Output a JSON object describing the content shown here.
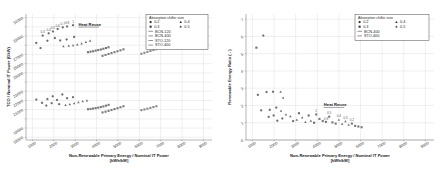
{
  "figure": {
    "background": "#ffffff",
    "panel_count": 2
  },
  "chart_data": [
    {
      "type": "scatter",
      "panel": "left",
      "title": "",
      "xlabel": "Non-Renewable Primary Energy / Nominal IT Power",
      "xlabel_units": "[kWh/kW]",
      "ylabel": "TCO / Nominal IT Power (€/kW)",
      "xlim": [
        700,
        9400
      ],
      "ylim": [
        17700,
        31400
      ],
      "xticks": [
        1000,
        2000,
        3000,
        4000,
        5000,
        6000,
        7000,
        8000,
        9000
      ],
      "yticks": [
        18000,
        19000,
        20000,
        21000,
        22000,
        23000,
        24000,
        25000,
        26000,
        27000,
        28000,
        29000,
        30000,
        31000
      ],
      "ytick_labels_shown": [
        18000,
        19000,
        21000,
        22000,
        23000,
        25000,
        26000,
        27000,
        29000,
        31000
      ],
      "grid": true,
      "grid_color": "#d9d9d9",
      "annotations": [
        {
          "text": "Heat Reuse",
          "x": 3150,
          "y": 30100,
          "underline": true
        }
      ],
      "legend": {
        "position": "top-right",
        "title": "Absorption chiller size",
        "size_entries": [
          {
            "label": "0.2",
            "marker": "hexagon"
          },
          {
            "label": "0.4",
            "marker": "triangle"
          },
          {
            "label": "0.3",
            "marker": "square"
          },
          {
            "label": "0.5",
            "marker": "star"
          }
        ],
        "line_entries": [
          {
            "label": "BCN-120",
            "marker": "line"
          },
          {
            "label": "BCN-400",
            "marker": "line"
          },
          {
            "label": "STO-120",
            "marker": "line"
          },
          {
            "label": "STO-400",
            "marker": "line"
          }
        ]
      },
      "series": [
        {
          "name": "BCN-120",
          "color": "#6f6f6f",
          "points": [
            {
              "x": 1180,
              "y": 28250,
              "m": "hexagon"
            },
            {
              "x": 1480,
              "y": 29050,
              "m": "hexagon",
              "label": "0.3"
            },
            {
              "x": 1760,
              "y": 29300,
              "m": "hexagon",
              "label": "0.4"
            },
            {
              "x": 1960,
              "y": 29500,
              "m": "hexagon",
              "label": "0.5"
            },
            {
              "x": 2180,
              "y": 29780,
              "m": "hexagon",
              "label": "0.6"
            },
            {
              "x": 2420,
              "y": 29950,
              "m": "hexagon",
              "label": "0.7"
            },
            {
              "x": 2620,
              "y": 30050,
              "m": "hexagon",
              "label": "0.8"
            },
            {
              "x": 2900,
              "y": 30180,
              "m": "hexagon",
              "label": "1"
            },
            {
              "x": 1380,
              "y": 27700,
              "m": "hexagon"
            },
            {
              "x": 1700,
              "y": 28500,
              "m": "hexagon"
            },
            {
              "x": 2050,
              "y": 28780,
              "m": "hexagon"
            },
            {
              "x": 2300,
              "y": 28520,
              "m": "hexagon"
            },
            {
              "x": 2600,
              "y": 28640,
              "m": "hexagon"
            },
            {
              "x": 2950,
              "y": 28900,
              "m": "hexagon"
            },
            {
              "x": 2450,
              "y": 27900,
              "m": "triangle"
            },
            {
              "x": 2700,
              "y": 27950,
              "m": "triangle"
            },
            {
              "x": 2900,
              "y": 28000,
              "m": "triangle"
            },
            {
              "x": 3100,
              "y": 28080,
              "m": "triangle"
            },
            {
              "x": 3300,
              "y": 28200,
              "m": "triangle"
            },
            {
              "x": 3500,
              "y": 28350,
              "m": "triangle"
            },
            {
              "x": 3700,
              "y": 28480,
              "m": "triangle"
            }
          ]
        },
        {
          "name": "BCN-120-band",
          "color": "#777777",
          "points": [
            {
              "x": 3600,
              "y": 27250,
              "m": "square"
            },
            {
              "x": 3720,
              "y": 27300,
              "m": "square"
            },
            {
              "x": 3840,
              "y": 27350,
              "m": "square"
            },
            {
              "x": 3960,
              "y": 27420,
              "m": "square"
            },
            {
              "x": 4080,
              "y": 27480,
              "m": "square"
            },
            {
              "x": 4200,
              "y": 27540,
              "m": "square"
            },
            {
              "x": 4320,
              "y": 27620,
              "m": "square"
            },
            {
              "x": 4440,
              "y": 27700,
              "m": "square"
            },
            {
              "x": 4560,
              "y": 27780,
              "m": "square"
            }
          ]
        },
        {
          "name": "BCN-400",
          "color": "#7d7d7d",
          "points": [
            {
              "x": 4280,
              "y": 26850,
              "m": "square"
            },
            {
              "x": 4420,
              "y": 26950,
              "m": "square"
            },
            {
              "x": 4560,
              "y": 27050,
              "m": "square"
            },
            {
              "x": 4700,
              "y": 27150,
              "m": "square"
            },
            {
              "x": 4840,
              "y": 27250,
              "m": "square"
            },
            {
              "x": 4980,
              "y": 27350,
              "m": "square"
            },
            {
              "x": 5120,
              "y": 27450,
              "m": "square"
            },
            {
              "x": 5260,
              "y": 27560,
              "m": "square"
            }
          ]
        },
        {
          "name": "STO-120",
          "color": "#888888",
          "points": [
            {
              "x": 6100,
              "y": 27080,
              "m": "square"
            },
            {
              "x": 6240,
              "y": 27180,
              "m": "square"
            },
            {
              "x": 6380,
              "y": 27280,
              "m": "square"
            },
            {
              "x": 6520,
              "y": 27380,
              "m": "square"
            },
            {
              "x": 6660,
              "y": 27480,
              "m": "square"
            },
            {
              "x": 6800,
              "y": 27570,
              "m": "square"
            }
          ]
        },
        {
          "name": "lower-cluster",
          "color": "#6f6f6f",
          "points": [
            {
              "x": 1180,
              "y": 22100,
              "m": "hexagon"
            },
            {
              "x": 1450,
              "y": 21750,
              "m": "hexagon"
            },
            {
              "x": 1700,
              "y": 22150,
              "m": "hexagon"
            },
            {
              "x": 1950,
              "y": 22450,
              "m": "hexagon"
            },
            {
              "x": 2150,
              "y": 22050,
              "m": "hexagon"
            },
            {
              "x": 2400,
              "y": 22650,
              "m": "hexagon"
            },
            {
              "x": 2620,
              "y": 22250,
              "m": "hexagon"
            },
            {
              "x": 2900,
              "y": 22350,
              "m": "hexagon"
            },
            {
              "x": 1650,
              "y": 21450,
              "m": "hexagon"
            },
            {
              "x": 1900,
              "y": 21700,
              "m": "hexagon"
            },
            {
              "x": 2250,
              "y": 21600,
              "m": "hexagon"
            },
            {
              "x": 2550,
              "y": 21500,
              "m": "triangle"
            },
            {
              "x": 2750,
              "y": 21600,
              "m": "triangle"
            },
            {
              "x": 2950,
              "y": 21700,
              "m": "triangle"
            },
            {
              "x": 3150,
              "y": 21800,
              "m": "triangle"
            },
            {
              "x": 3350,
              "y": 21900,
              "m": "triangle"
            },
            {
              "x": 3550,
              "y": 22000,
              "m": "triangle"
            }
          ]
        },
        {
          "name": "lower-band-1",
          "color": "#7a7a7a",
          "points": [
            {
              "x": 3600,
              "y": 21050,
              "m": "square"
            },
            {
              "x": 3720,
              "y": 21080,
              "m": "square"
            },
            {
              "x": 3840,
              "y": 21120,
              "m": "square"
            },
            {
              "x": 3960,
              "y": 21170,
              "m": "square"
            },
            {
              "x": 4080,
              "y": 21220,
              "m": "square"
            },
            {
              "x": 4200,
              "y": 21280,
              "m": "square"
            },
            {
              "x": 4320,
              "y": 21350,
              "m": "square"
            },
            {
              "x": 4440,
              "y": 21430,
              "m": "square"
            },
            {
              "x": 4560,
              "y": 21520,
              "m": "square"
            }
          ]
        },
        {
          "name": "lower-band-2",
          "color": "#7a7a7a",
          "points": [
            {
              "x": 4280,
              "y": 20700,
              "m": "square"
            },
            {
              "x": 4420,
              "y": 20780,
              "m": "square"
            },
            {
              "x": 4560,
              "y": 20870,
              "m": "square"
            },
            {
              "x": 4700,
              "y": 20960,
              "m": "square"
            },
            {
              "x": 4840,
              "y": 21060,
              "m": "square"
            },
            {
              "x": 4980,
              "y": 21160,
              "m": "square"
            },
            {
              "x": 5120,
              "y": 21260,
              "m": "square"
            },
            {
              "x": 5260,
              "y": 21370,
              "m": "square"
            }
          ]
        },
        {
          "name": "lower-band-3",
          "color": "#888888",
          "points": [
            {
              "x": 6100,
              "y": 20950,
              "m": "square"
            },
            {
              "x": 6240,
              "y": 21020,
              "m": "square"
            },
            {
              "x": 6380,
              "y": 21100,
              "m": "square"
            },
            {
              "x": 6520,
              "y": 21190,
              "m": "square"
            },
            {
              "x": 6660,
              "y": 21280,
              "m": "square"
            },
            {
              "x": 6800,
              "y": 21370,
              "m": "square"
            }
          ]
        }
      ]
    },
    {
      "type": "scatter",
      "panel": "right",
      "title": "",
      "xlabel": "Non-Renewable Primary Energy / Nominal IT Power",
      "xlabel_units": "[kWh/kW]",
      "ylabel": "Renewable Energy Ratio ( - )",
      "xlim": [
        700,
        9400
      ],
      "ylim": [
        0,
        7.3
      ],
      "xticks": [
        1000,
        2000,
        3000,
        4000,
        5000,
        6000,
        7000,
        8000,
        9000
      ],
      "yticks": [
        0,
        1,
        2,
        3,
        4,
        5,
        6,
        7
      ],
      "grid": true,
      "grid_color": "#d9d9d9",
      "annotations": [
        {
          "text": "Heat Reuse",
          "x": 4300,
          "y": 1.95,
          "underline": true
        }
      ],
      "legend": {
        "position": "top-right",
        "title": "Absorption chiller size",
        "size_entries": [
          {
            "label": "0.2",
            "marker": "hexagon"
          },
          {
            "label": "0.4",
            "marker": "triangle"
          },
          {
            "label": "0.3",
            "marker": "square"
          },
          {
            "label": "0.5",
            "marker": "star"
          }
        ],
        "line_entries": [
          {
            "label": "BCN-400",
            "marker": "line"
          },
          {
            "label": "STO-400",
            "marker": "line"
          }
        ]
      },
      "series": [
        {
          "name": "high-ratio",
          "color": "#6f6f6f",
          "points": [
            {
              "x": 1180,
              "y": 5.35,
              "m": "square"
            },
            {
              "x": 1500,
              "y": 6.05,
              "m": "hexagon"
            }
          ]
        },
        {
          "name": "mid-cluster",
          "color": "#6f6f6f",
          "points": [
            {
              "x": 1250,
              "y": 2.62,
              "m": "hexagon"
            },
            {
              "x": 1650,
              "y": 2.78,
              "m": "hexagon"
            },
            {
              "x": 1950,
              "y": 2.8,
              "m": "hexagon"
            },
            {
              "x": 2300,
              "y": 2.8,
              "m": "triangle"
            },
            {
              "x": 2420,
              "y": 2.45,
              "m": "triangle"
            },
            {
              "x": 1400,
              "y": 1.72,
              "m": "hexagon"
            },
            {
              "x": 1800,
              "y": 1.75,
              "m": "hexagon"
            },
            {
              "x": 2100,
              "y": 1.88,
              "m": "hexagon"
            },
            {
              "x": 2320,
              "y": 1.7,
              "m": "triangle"
            },
            {
              "x": 1750,
              "y": 1.34,
              "m": "hexagon"
            },
            {
              "x": 1980,
              "y": 1.42,
              "m": "hexagon"
            },
            {
              "x": 2150,
              "y": 1.12,
              "m": "hexagon"
            },
            {
              "x": 2380,
              "y": 1.25,
              "m": "hexagon"
            },
            {
              "x": 2550,
              "y": 1.48,
              "m": "triangle"
            },
            {
              "x": 2750,
              "y": 1.38,
              "m": "triangle"
            },
            {
              "x": 2880,
              "y": 1.1,
              "m": "hexagon"
            },
            {
              "x": 3050,
              "y": 1.18,
              "m": "triangle"
            },
            {
              "x": 3150,
              "y": 1.55,
              "m": "square"
            },
            {
              "x": 3300,
              "y": 1.3,
              "m": "triangle"
            },
            {
              "x": 3450,
              "y": 1.05,
              "m": "triangle"
            },
            {
              "x": 3600,
              "y": 1.42,
              "m": "square"
            },
            {
              "x": 3700,
              "y": 1.12,
              "m": "triangle"
            },
            {
              "x": 3850,
              "y": 1.0,
              "m": "square"
            }
          ]
        },
        {
          "name": "decline-band",
          "color": "#7a7a7a",
          "points": [
            {
              "x": 3950,
              "y": 1.48,
              "m": "square",
              "label": "1"
            },
            {
              "x": 4100,
              "y": 1.22,
              "m": "square"
            },
            {
              "x": 4250,
              "y": 1.1,
              "m": "square"
            },
            {
              "x": 4400,
              "y": 1.05,
              "m": "square",
              "label": "0.8"
            },
            {
              "x": 4550,
              "y": 1.35,
              "m": "square",
              "label": "0.5"
            },
            {
              "x": 4700,
              "y": 1.02,
              "m": "square"
            },
            {
              "x": 4850,
              "y": 0.95,
              "m": "square"
            },
            {
              "x": 5000,
              "y": 1.18,
              "m": "triangle",
              "label": "0.4"
            },
            {
              "x": 5150,
              "y": 0.92,
              "m": "triangle"
            },
            {
              "x": 5300,
              "y": 1.08,
              "m": "triangle",
              "label": "0.3"
            },
            {
              "x": 5450,
              "y": 0.88,
              "m": "triangle"
            },
            {
              "x": 5600,
              "y": 0.95,
              "m": "square",
              "label": "0.2"
            },
            {
              "x": 5750,
              "y": 0.82,
              "m": "square"
            },
            {
              "x": 5900,
              "y": 0.78,
              "m": "square"
            },
            {
              "x": 6050,
              "y": 0.74,
              "m": "square"
            }
          ]
        }
      ]
    }
  ]
}
